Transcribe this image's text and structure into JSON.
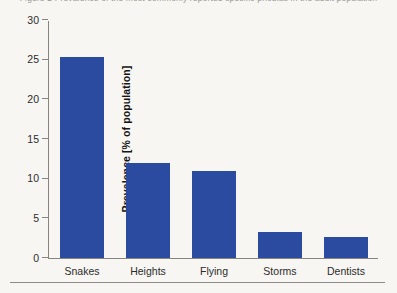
{
  "figure": {
    "top_caption_sliver": "Figure 2  Prevalence of the most commonly reported specific phobias in the adult population",
    "background_color": "#f7f6f2",
    "axis_color": "#86847e",
    "rule_color": "#8d8b85"
  },
  "chart_data": {
    "type": "bar",
    "title": "",
    "xlabel": "",
    "ylabel": "Prevalence [% of population]",
    "categories": [
      "Snakes",
      "Heights",
      "Flying",
      "Storms",
      "Dentists"
    ],
    "values": [
      25.3,
      12.0,
      11.0,
      3.3,
      2.7
    ],
    "series": [
      {
        "name": "Prevalence",
        "values": [
          25.3,
          12.0,
          11.0,
          3.3,
          2.7
        ],
        "color": "#2b4ba0"
      }
    ],
    "ylim": [
      0,
      30
    ],
    "yticks": [
      0,
      5,
      10,
      15,
      20,
      25,
      30
    ],
    "ytick_labels": [
      "0",
      "5",
      "10",
      "15",
      "20",
      "25",
      "30"
    ],
    "xticks_visible": false,
    "grid": false,
    "legend": false,
    "legend_position": "none",
    "bar_color": "#2b4ba0"
  }
}
